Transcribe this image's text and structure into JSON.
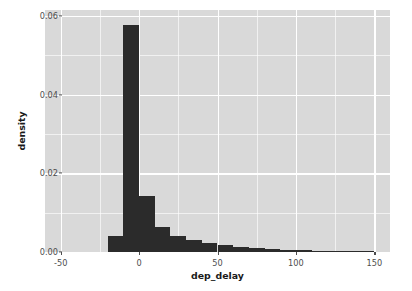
{
  "chart_data": {
    "type": "bar",
    "title": "",
    "xlabel": "dep_delay",
    "ylabel": "density",
    "xlim": [
      -60,
      160
    ],
    "ylim": [
      0,
      0.0615
    ],
    "xticks": [
      -50,
      0,
      50,
      100,
      150
    ],
    "xtick_labels": [
      "-50",
      "0",
      "50",
      "100",
      "150"
    ],
    "yticks": [
      0.0,
      0.02,
      0.04,
      0.06
    ],
    "ytick_labels": [
      "0.00",
      "0.02",
      "0.04",
      "0.06"
    ],
    "x_minor_ticks": [
      -25,
      25,
      75,
      125
    ],
    "y_minor_ticks": [
      0.01,
      0.03,
      0.05
    ],
    "grid": true,
    "legend": "none",
    "bin_width": 10,
    "bin_starts": [
      -20,
      -10,
      0,
      10,
      20,
      30,
      40,
      50,
      60,
      70,
      80,
      90,
      100,
      110,
      120,
      130,
      140
    ],
    "values": [
      0.004,
      0.0578,
      0.0143,
      0.0063,
      0.004,
      0.003,
      0.0023,
      0.0017,
      0.0013,
      0.0009,
      0.0007,
      0.0005,
      0.0004,
      0.0003,
      0.0002,
      0.0002,
      0.0001
    ],
    "bar_color": "#2b2b2b",
    "panel_color": "#d9d9d9",
    "grid_color": "#ffffff",
    "axis_text_color": "#4d4d4d"
  }
}
